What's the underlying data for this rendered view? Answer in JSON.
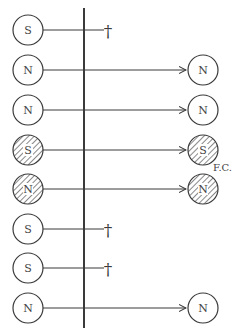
{
  "diagram": {
    "colors": {
      "ink": "#3a3a3a",
      "background": "#ffffff",
      "hatch": "#555555"
    },
    "barrier_x": 84,
    "barrier_y": [
      8,
      328
    ],
    "rows": [
      {
        "left_label": "S",
        "hatched": false,
        "outcome": "dies",
        "right_label": ""
      },
      {
        "left_label": "N",
        "hatched": false,
        "outcome": "passes",
        "right_label": "N"
      },
      {
        "left_label": "N",
        "hatched": false,
        "outcome": "passes",
        "right_label": "N"
      },
      {
        "left_label": "S",
        "hatched": true,
        "outcome": "passes",
        "right_label": "S"
      },
      {
        "left_label": "N",
        "hatched": true,
        "outcome": "passes",
        "right_label": "N"
      },
      {
        "left_label": "S",
        "hatched": false,
        "outcome": "dies",
        "right_label": ""
      },
      {
        "left_label": "S",
        "hatched": false,
        "outcome": "dies",
        "right_label": ""
      },
      {
        "left_label": "N",
        "hatched": false,
        "outcome": "passes",
        "right_label": "N"
      }
    ],
    "dagger_symbol": "†",
    "annotation": "F.C."
  }
}
